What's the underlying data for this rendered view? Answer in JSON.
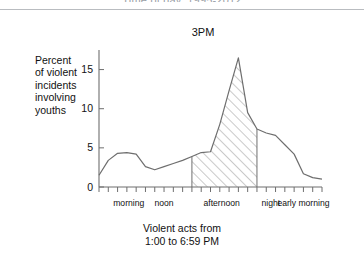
{
  "page": {
    "cut_off_header": "Time of day, 1995-2012",
    "caption_line1": "Violent acts from",
    "caption_line2": "1:00 to 6:59 PM"
  },
  "chart": {
    "peak_annotation": "3PM",
    "y_axis_title": "Percent of violent incidents involving youths",
    "y_axis_title_lines": [
      "Percent",
      "of violent",
      "incidents",
      "involving",
      "youths"
    ],
    "y_ticks": [
      "0",
      "5",
      "10",
      "15"
    ],
    "x_categories": [
      "morning",
      "noon",
      "afternoon",
      "night",
      "early morning"
    ],
    "colors": {
      "line": "#6e6e6e",
      "axis": "#6e6e6e",
      "hatch": "#8a8a8a",
      "text": "#111111",
      "rule": "#b9bcc0",
      "background": "#ffffff"
    }
  },
  "chart_data": {
    "type": "area",
    "title": "",
    "subtitle": "",
    "xlabel": "",
    "ylabel": "Percent of violent incidents involving youths",
    "annotations": [
      {
        "text": "3PM",
        "x": 15,
        "y": 16.5
      },
      {
        "text": "Violent acts from 1:00 to 6:59 PM",
        "x": 16,
        "y": 0
      }
    ],
    "grid": false,
    "legend": null,
    "xlim": [
      0,
      24
    ],
    "ylim": [
      0,
      17.5
    ],
    "y_tick_values": [
      0,
      5,
      10,
      15
    ],
    "x_tick_values": [
      0,
      1,
      2,
      3,
      4,
      5,
      6,
      7,
      8,
      9,
      10,
      11,
      12,
      13,
      14,
      15,
      16,
      17,
      18,
      19,
      20,
      21,
      22,
      23,
      24
    ],
    "x_category_positions": [
      {
        "label": "morning",
        "x": 3.2
      },
      {
        "label": "noon",
        "x": 7.0
      },
      {
        "label": "afternoon",
        "x": 13.2
      },
      {
        "label": "night",
        "x": 18.5
      },
      {
        "label": "early morning",
        "x": 22.0
      }
    ],
    "shaded_region": {
      "label": "Violent acts from 1:00 to 6:59 PM",
      "x_start": 10.0,
      "x_end": 17.0,
      "fill": "diagonal-hatch"
    },
    "x": [
      0,
      1,
      2,
      3,
      4,
      5,
      6,
      7,
      8,
      9,
      10,
      11,
      12,
      13,
      14,
      15,
      16,
      17,
      18,
      19,
      20,
      21,
      22,
      23,
      24
    ],
    "values": [
      1.5,
      3.4,
      4.3,
      4.4,
      4.2,
      2.6,
      2.2,
      2.6,
      3.0,
      3.4,
      3.9,
      4.4,
      4.5,
      8.0,
      12.3,
      16.5,
      9.5,
      7.4,
      6.9,
      6.6,
      5.4,
      4.2,
      1.7,
      1.2,
      1.0
    ],
    "series": [
      {
        "name": "Percent of violent incidents involving youths",
        "values": [
          1.5,
          3.4,
          4.3,
          4.4,
          4.2,
          2.6,
          2.2,
          2.6,
          3.0,
          3.4,
          3.9,
          4.4,
          4.5,
          8.0,
          12.3,
          16.5,
          9.5,
          7.4,
          6.9,
          6.6,
          5.4,
          4.2,
          1.7,
          1.2,
          1.0
        ]
      }
    ]
  }
}
